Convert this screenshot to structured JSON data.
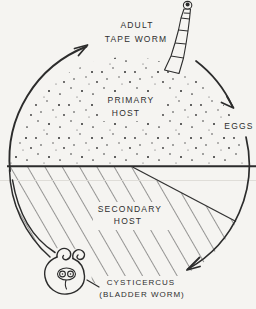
{
  "figure": {
    "stages": {
      "adult_tape_worm": {
        "line1": "ADULT",
        "line2": "TAPE WORM"
      },
      "primary_host": {
        "line1": "PRIMARY",
        "line2": "HOST"
      },
      "eggs": {
        "label": "EGGS"
      },
      "secondary_host": {
        "line1": "SECONDARY",
        "line2": "HOST"
      },
      "cysticercus": {
        "line1": "CYSTICERCUS",
        "line2": "(BLADDER WORM)"
      }
    },
    "colors": {
      "paper": "#f5f4f1",
      "ink": "#2e2e2e"
    }
  }
}
